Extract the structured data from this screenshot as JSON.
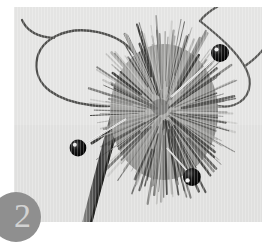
{
  "figure": {
    "badge_number": "2",
    "caption_alt": "Burr seed head with dark wire loops and three black-headed pins inserted",
    "colors": {
      "page_background": "#ffffff",
      "photo_background": "#e4e4e3",
      "badge_fill": "#8f8f8f",
      "badge_text": "#d2d2d2",
      "burr_light": "#a8a8a6",
      "burr_mid": "#8a8a88",
      "burr_dark": "#3a3a38",
      "wire": "#4a4a48",
      "pin_head": "#0a0a0a",
      "pin_shaft": "#f2f2f0",
      "stem": "#6e6e6c"
    },
    "photo": {
      "x": 14,
      "y": 7,
      "width": 248,
      "height": 215
    },
    "subject": {
      "burr": {
        "cx": 150,
        "cy": 105,
        "rx": 66,
        "ry": 82,
        "spine_count": 168
      },
      "pins": [
        {
          "name": "pin-upper-right",
          "head_x": 206,
          "head_y": 46,
          "head_r": 9,
          "tip_x": 158,
          "tip_y": 89
        },
        {
          "name": "pin-lower-left",
          "head_x": 64,
          "head_y": 141,
          "head_r": 8,
          "tip_x": 110,
          "tip_y": 113
        },
        {
          "name": "pin-lower-right",
          "head_x": 178,
          "head_y": 170,
          "head_r": 9,
          "tip_x": 154,
          "tip_y": 142
        }
      ],
      "wires": [
        {
          "name": "wire-left-loop"
        },
        {
          "name": "wire-right-loop"
        }
      ],
      "stem": {
        "name": "stem",
        "top_x": 106,
        "top_y": 100,
        "bottom_x": 76,
        "bottom_y": 222
      }
    }
  }
}
